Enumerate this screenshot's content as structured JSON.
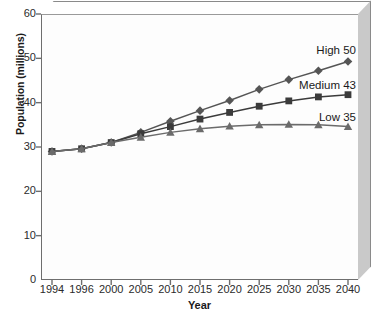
{
  "chart_data": {
    "type": "line",
    "title": "",
    "xlabel": "Year",
    "ylabel": "Population (millions)",
    "categories": [
      "1994",
      "1996",
      "2000",
      "2005",
      "2010",
      "2015",
      "2020",
      "2025",
      "2030",
      "2035",
      "2040"
    ],
    "ylim": [
      0,
      60
    ],
    "yticks": [
      0,
      10,
      20,
      30,
      40,
      50,
      60
    ],
    "xlim_categorical": true,
    "grid": false,
    "legend": "series-end-labels",
    "series": [
      {
        "name": "High",
        "end_label": "High 50",
        "end_value": 50,
        "marker": "diamond",
        "color": "#555555",
        "values": [
          29.0,
          29.6,
          31.0,
          33.3,
          35.8,
          38.2,
          40.5,
          43.0,
          45.2,
          47.2,
          49.3
        ]
      },
      {
        "name": "Medium",
        "end_label": "Medium 43",
        "end_value": 43,
        "marker": "square",
        "color": "#3b3b3b",
        "values": [
          29.0,
          29.6,
          31.0,
          33.0,
          34.6,
          36.3,
          37.8,
          39.2,
          40.4,
          41.3,
          41.8
        ]
      },
      {
        "name": "Low",
        "end_label": "Low 35",
        "end_value": 35,
        "marker": "triangle",
        "color": "#6b6b6b",
        "values": [
          29.0,
          29.6,
          31.0,
          32.2,
          33.3,
          34.1,
          34.7,
          35.0,
          35.1,
          35.0,
          34.6
        ]
      }
    ],
    "colors": {
      "axis": "#6e6e6e",
      "text": "#1a1a1a",
      "plot_background": "#fdfdfd",
      "frame_shadow": "#c9c9c9",
      "page_background": "#ffffff"
    }
  }
}
